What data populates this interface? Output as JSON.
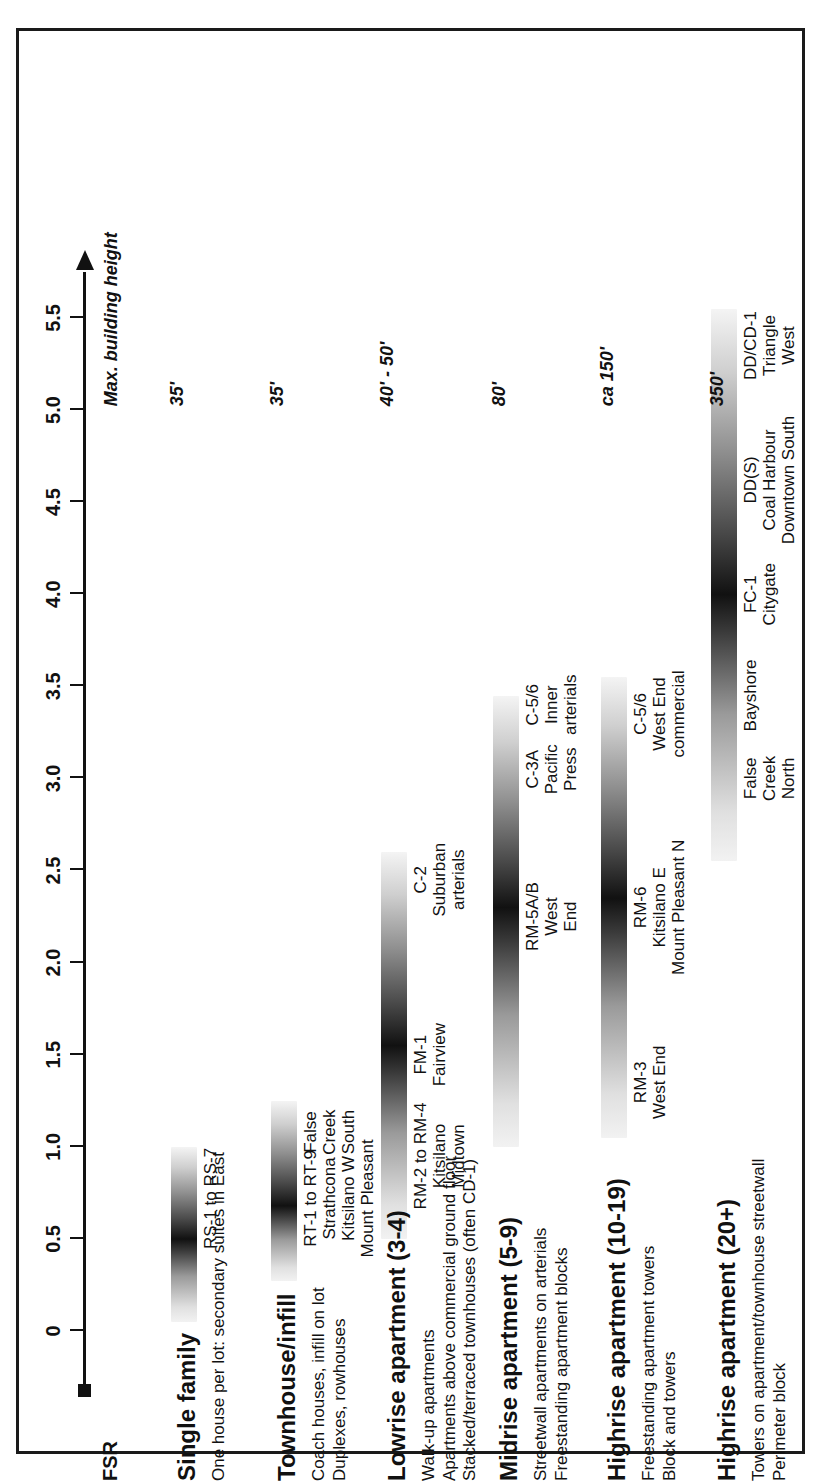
{
  "chart_data": {
    "type": "bar",
    "title": "",
    "xlabel": "FSR",
    "ylabel": "",
    "axis_label": "FSR",
    "axis_min": 0,
    "axis_max": 5.75,
    "tick_values": [
      0,
      0.5,
      1.0,
      1.5,
      2.0,
      2.5,
      3.0,
      3.5,
      4.0,
      4.5,
      5.0,
      5.5
    ],
    "tick_labels": [
      "0",
      "0.5",
      "1.0",
      "1.5",
      "2.0",
      "2.5",
      "3.0",
      "3.5",
      "4.0",
      "4.5",
      "5.0",
      "5.5"
    ],
    "secondary_axis_label": "Max. building height",
    "grid": false,
    "legend": "none",
    "categories": [
      {
        "name": "Single family",
        "description": "One house per lot: secondary suites in East",
        "max_height": "35'",
        "fsr_min": 0.05,
        "fsr_max": 1.0,
        "peak": 0.5,
        "zones": [
          {
            "label": "RS-1 to RS-7",
            "areas": "",
            "fsr": 0.72
          }
        ]
      },
      {
        "name": "Townhouse/infill",
        "description": "Coach houses, infill on lot\nDuplexes, rowhouses",
        "max_height": "35'",
        "fsr_min": 0.27,
        "fsr_max": 1.25,
        "peak": 0.68,
        "zones": [
          {
            "label": "RT-1 to RT-9",
            "areas": "Strathcona\nKitsilano W\nMount Pleasant",
            "fsr": 0.72
          },
          {
            "label": "",
            "areas": "False\nCreek\nSouth",
            "fsr": 1.08
          }
        ]
      },
      {
        "name": "Lowrise apartment (3-4)",
        "description": "Walk-up apartments\nApartments above commercial ground floor\nStacked/terraced townhouses (often CD-1)",
        "max_height": "40' - 50'",
        "fsr_min": 0.5,
        "fsr_max": 2.6,
        "peak": 1.55,
        "zones": [
          {
            "label": "RM-2 to RM-4",
            "areas": "Kitsilano\nMidtown",
            "fsr": 0.95
          },
          {
            "label": "FM-1",
            "areas": "Fairview",
            "fsr": 1.5
          },
          {
            "label": "C-2",
            "areas": "Suburban\narterials",
            "fsr": 2.45
          }
        ]
      },
      {
        "name": "Midrise apartment (5-9)",
        "description": "Streetwall apartments on arterials\nFreestanding apartment blocks",
        "max_height": "80'",
        "fsr_min": 1.0,
        "fsr_max": 3.45,
        "peak": 2.3,
        "zones": [
          {
            "label": "RM-5A/B",
            "areas": "West\nEnd",
            "fsr": 2.25
          },
          {
            "label": "C-3A",
            "areas": "Pacific\nPress",
            "fsr": 3.05
          },
          {
            "label": "C-5/6",
            "areas": "Inner\narterials",
            "fsr": 3.4
          }
        ]
      },
      {
        "name": "Highrise apartment (10-19)",
        "description": "Freestanding apartment towers\nBlock and towers",
        "max_height": "ca 150'",
        "fsr_min": 1.05,
        "fsr_max": 3.55,
        "peak": 2.35,
        "zones": [
          {
            "label": "RM-3",
            "areas": "West End",
            "fsr": 1.35
          },
          {
            "label": "RM-6",
            "areas": "Kitsilano E\nMount Pleasant N",
            "fsr": 2.3
          },
          {
            "label": "C-5/6",
            "areas": "West End\ncommercial",
            "fsr": 3.35
          }
        ]
      },
      {
        "name": "Highrise apartment (20+)",
        "description": "Towers on apartment/townhouse streetwall\nPerimeter block",
        "max_height": "350'",
        "fsr_min": 2.55,
        "fsr_max": 5.55,
        "peak": 4.0,
        "zones": [
          {
            "label": "",
            "areas": "False\nCreek\nNorth",
            "fsr": 3.0
          },
          {
            "label": "",
            "areas": "Bayshore",
            "fsr": 3.45
          },
          {
            "label": "FC-1",
            "areas": "Citygate",
            "fsr": 4.0
          },
          {
            "label": "DD(S)",
            "areas": "Coal Harbour\nDowntown South",
            "fsr": 4.62
          },
          {
            "label": "DD/CD-1",
            "areas": "Triangle\nWest",
            "fsr": 5.35
          }
        ]
      }
    ]
  }
}
